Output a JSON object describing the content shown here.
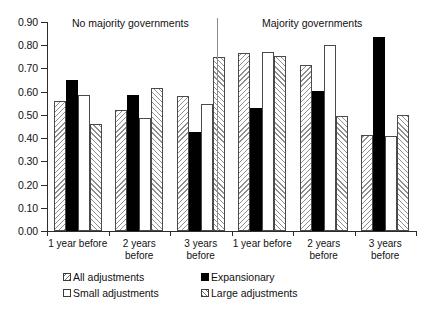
{
  "chart_data": {
    "type": "bar",
    "title": "",
    "xlabel": "",
    "ylabel": "",
    "ylim": [
      0.0,
      0.9
    ],
    "grid": false,
    "legend_position": "bottom",
    "panels": [
      {
        "title": "No majority governments",
        "categories": [
          "1 year before",
          "2 years\nbefore",
          "3 years\nbefore"
        ],
        "series": [
          {
            "name": "All adjustments",
            "values": [
              0.56,
              0.52,
              0.58
            ]
          },
          {
            "name": "Expansionary",
            "values": [
              0.65,
              0.585,
              0.425
            ]
          },
          {
            "name": "Small adjustments",
            "values": [
              0.585,
              0.485,
              0.545
            ]
          },
          {
            "name": "Large adjustments",
            "values": [
              0.46,
              0.615,
              0.75
            ]
          }
        ]
      },
      {
        "title": "Majority governments",
        "categories": [
          "1 year before",
          "2 years\nbefore",
          "3 years\nbefore"
        ],
        "series": [
          {
            "name": "All adjustments",
            "values": [
              0.765,
              0.715,
              0.415
            ]
          },
          {
            "name": "Expansionary",
            "values": [
              0.53,
              0.605,
              0.835
            ]
          },
          {
            "name": "Small adjustments",
            "values": [
              0.77,
              0.8,
              0.41
            ]
          },
          {
            "name": "Large adjustments",
            "values": [
              0.755,
              0.495,
              0.5
            ]
          }
        ]
      }
    ],
    "ytick_labels": [
      "0.90",
      "0.80",
      "0.70",
      "0.60",
      "0.50",
      "0.40",
      "0.30",
      "0.20",
      "0.10",
      "0.00"
    ],
    "ytick_values": [
      0.9,
      0.8,
      0.7,
      0.6,
      0.5,
      0.4,
      0.3,
      0.2,
      0.1,
      0.0
    ],
    "legend": [
      {
        "name": "All adjustments",
        "style": "all"
      },
      {
        "name": "Expansionary",
        "style": "exp"
      },
      {
        "name": "Small adjustments",
        "style": "small"
      },
      {
        "name": "Large adjustments",
        "style": "large"
      }
    ],
    "colors": {
      "expansionary": "#000000",
      "small_adjustments": "#ffffff",
      "hatch": "#8f8f8f",
      "axis": "#2b2b2b",
      "divider": "#8d8d8d"
    }
  }
}
